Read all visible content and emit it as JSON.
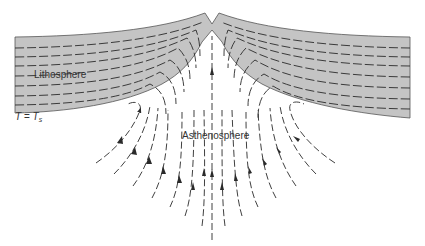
{
  "figure": {
    "type": "cross-section diagram",
    "labels": {
      "lithosphere": "Lithosphere",
      "asthenosphere": "Asthenosphere",
      "isotherm_T": "T",
      "isotherm_eq": " = ",
      "isotherm_Ts": "T",
      "isotherm_sub": "s"
    },
    "colors": {
      "lithosphere_fill": "#c4c4c4",
      "line": "#2a2a2a",
      "background": "#ffffff"
    },
    "elements": {
      "ridge_crest_x": 212,
      "flow_direction": "upwelling at ridge axis, diverging laterally into lithosphere",
      "arrow_count": 15
    }
  }
}
